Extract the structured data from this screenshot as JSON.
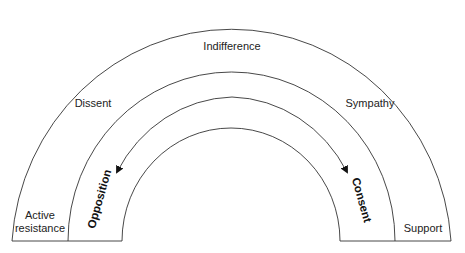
{
  "diagram": {
    "type": "nested semicircular arcs",
    "outer_band": {
      "top_label": "Indifference",
      "left_label_line1": "Active",
      "left_label_line2": "resistance",
      "right_label": "Support"
    },
    "middle_band": {
      "left_label": "Dissent",
      "right_label": "Sympathy"
    },
    "inner_band": {
      "left_arrow_label": "Opposition",
      "right_arrow_label": "Consent"
    },
    "colors": {
      "stroke": "#333333",
      "text": "#222222",
      "background": "#ffffff"
    }
  }
}
